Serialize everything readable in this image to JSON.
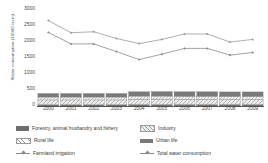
{
  "chart_data": {
    "type": "bar",
    "title": "",
    "xlabel": "",
    "ylabel": "Water consumption (10000 cu.m)",
    "categories": [
      "2000",
      "2001",
      "2002",
      "2003",
      "2004",
      "2005",
      "2006",
      "2007",
      "2008",
      "2009"
    ],
    "ylim": [
      0,
      3000
    ],
    "yticks": [
      "0",
      "500",
      "1000",
      "1500",
      "2000",
      "2500",
      "3000"
    ],
    "grid": false,
    "legend_position": "bottom",
    "stacked_bars": true,
    "series": [
      {
        "name": "Forestry, animal husbandry and fishery",
        "kind": "bar",
        "swatch": "solid-dark",
        "color": "#6e6e6e",
        "values": [
          40,
          40,
          40,
          40,
          45,
          45,
          45,
          45,
          45,
          45
        ]
      },
      {
        "name": "Industry",
        "kind": "bar",
        "swatch": "sparse-hatch",
        "color": "#d8d8d8",
        "values": [
          150,
          150,
          150,
          150,
          170,
          170,
          165,
          165,
          160,
          160
        ]
      },
      {
        "name": "Rural life",
        "kind": "bar",
        "swatch": "diagonal-hatch",
        "color": "#ffffff",
        "values": [
          90,
          90,
          90,
          90,
          95,
          95,
          95,
          95,
          95,
          95
        ]
      },
      {
        "name": "Urban life",
        "kind": "bar",
        "swatch": "solid-dark",
        "color": "#7a7a7a",
        "values": [
          110,
          110,
          110,
          110,
          135,
          140,
          140,
          140,
          140,
          140
        ]
      },
      {
        "name": "Farmland irrigation",
        "kind": "line",
        "swatch": "line-marker",
        "color": "#8a8a8a",
        "values": [
          2300,
          1940,
          1940,
          1700,
          1450,
          1620,
          1800,
          1800,
          1590,
          1670
        ]
      },
      {
        "name": "Total water consumption",
        "kind": "line",
        "swatch": "line-marker",
        "color": "#9a9a9a",
        "values": [
          2670,
          2290,
          2320,
          2110,
          1950,
          2080,
          2250,
          2250,
          2000,
          2080
        ]
      }
    ]
  },
  "legend": {
    "rows": [
      {
        "left": "Forestry, animal husbandry and fishery",
        "right": "Industry"
      },
      {
        "left": "Rural life",
        "right": "Urban life"
      },
      {
        "left": "Farmland irrigation",
        "right": "Total water consumption"
      }
    ]
  }
}
